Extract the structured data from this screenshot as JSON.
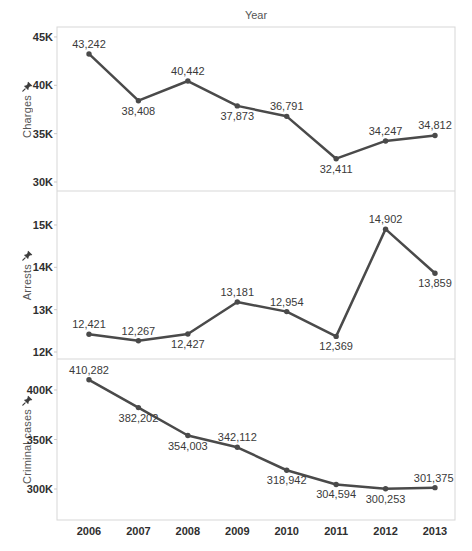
{
  "chart_data": {
    "type": "line",
    "title": "Year",
    "categories": [
      "2006",
      "2007",
      "2008",
      "2009",
      "2010",
      "2011",
      "2012",
      "2013"
    ],
    "grid": false,
    "legend": "none",
    "colors": {
      "line": "#4a4a4a",
      "marker": "#4a4a4a",
      "data_label": "#3a3a3a",
      "tick_label": "#2f2f2f",
      "axis_title": "#555555",
      "border": "#d7d7d7",
      "tick_mark": "#c9c9c9",
      "pin_icon": "#3d3d3d"
    },
    "panels": [
      {
        "ylabel": "Charges",
        "values": [
          43242,
          38408,
          40442,
          37873,
          36791,
          32411,
          34247,
          34812
        ],
        "labels": [
          "43,242",
          "38,408",
          "40,442",
          "37,873",
          "36,791",
          "32,411",
          "34,247",
          "34,812"
        ],
        "label_side": [
          "above",
          "below",
          "above",
          "below",
          "above",
          "below",
          "above",
          "above"
        ],
        "ylim": [
          29070,
          46030
        ],
        "yticks": [
          {
            "v": 30000,
            "label": "30K"
          },
          {
            "v": 35000,
            "label": "35K"
          },
          {
            "v": 40000,
            "label": "40K"
          },
          {
            "v": 45000,
            "label": "45K"
          }
        ]
      },
      {
        "ylabel": "Arrests",
        "values": [
          12421,
          12267,
          12427,
          13181,
          12954,
          12369,
          14902,
          13859
        ],
        "labels": [
          "12,421",
          "12,267",
          "12,427",
          "13,181",
          "12,954",
          "12,369",
          "14,902",
          "13,859"
        ],
        "label_side": [
          "above",
          "above",
          "below",
          "above",
          "above",
          "below",
          "above",
          "below"
        ],
        "ylim": [
          11835,
          15803
        ],
        "yticks": [
          {
            "v": 12000,
            "label": "12K"
          },
          {
            "v": 13000,
            "label": "13K"
          },
          {
            "v": 14000,
            "label": "14K"
          },
          {
            "v": 15000,
            "label": "15K"
          }
        ]
      },
      {
        "ylabel": "Criminal cases",
        "values": [
          410282,
          382202,
          354003,
          342112,
          318942,
          304594,
          300253,
          301375
        ],
        "labels": [
          "410,282",
          "382,202",
          "354,003",
          "342,112",
          "318,942",
          "304,594",
          "300,253",
          "301,375"
        ],
        "label_side": [
          "above",
          "below",
          "below",
          "above",
          "below",
          "below",
          "below",
          "above"
        ],
        "ylim": [
          268700,
          431300
        ],
        "yticks": [
          {
            "v": 300000,
            "label": "300K"
          },
          {
            "v": 350000,
            "label": "350K"
          },
          {
            "v": 400000,
            "label": "400K"
          }
        ]
      }
    ]
  }
}
